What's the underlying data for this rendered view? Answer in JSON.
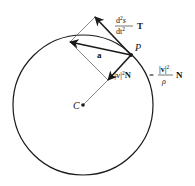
{
  "diagram": {
    "colors": {
      "stroke": "#1a1a1a",
      "thin": "#555555",
      "background": "#ffffff"
    },
    "circle": {
      "cx": 83,
      "cy": 105,
      "r": 70
    },
    "points": {
      "P": {
        "label": "P",
        "x": 131,
        "y": 55
      },
      "C": {
        "label": "C",
        "x": 83,
        "y": 105
      }
    },
    "vectors": {
      "tangential": {
        "from": [
          131,
          55
        ],
        "to": [
          95,
          17
        ]
      },
      "acceleration": {
        "from": [
          131,
          55
        ],
        "to": [
          70,
          42
        ],
        "label": "a"
      },
      "normal": {
        "from": [
          131,
          55
        ],
        "to": [
          108,
          80
        ]
      }
    },
    "labels": {
      "tangential_num": "d",
      "tangential_num_sup": "2",
      "tangential_num_var": "s",
      "tangential_den": "dt",
      "tangential_den_sup": "2",
      "tangential_unit": "T",
      "normal_left": "κ|v|",
      "normal_left_sup": "2",
      "normal_left_unit": "N",
      "equals": "=",
      "normal_frac_num": "|v|",
      "normal_frac_num_sup": "2",
      "normal_frac_den": "ρ",
      "normal_right_unit": "N",
      "a": "a",
      "P": "P",
      "C": "C"
    }
  }
}
